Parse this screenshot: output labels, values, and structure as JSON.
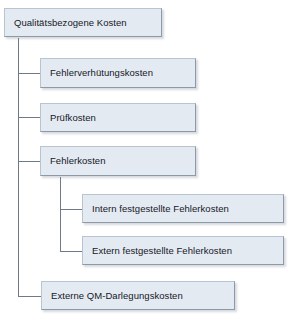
{
  "diagram": {
    "title": "Qualitätsbezogene Kosten",
    "type": "tree-hierarchy",
    "orientation": "vertical-left-trunk",
    "colors": {
      "box_fill": "#e4eaf2",
      "box_border_light": "#b9c4d2",
      "box_border_dark": "#8e99a8",
      "connector_line": "#6f7a88",
      "text": "#14181f",
      "background": "#ffffff"
    },
    "nodes": [
      {
        "id": "root",
        "label": "Qualitätsbezogene Kosten",
        "level": 0,
        "x": 4,
        "y": 8,
        "w": 158,
        "h": 29
      },
      {
        "id": "fehlerverhuetungskosten",
        "label": "Fehlerverhütungskosten",
        "level": 1,
        "x": 40,
        "y": 58,
        "w": 156,
        "h": 30
      },
      {
        "id": "pruefkosten",
        "label": "Prüfkosten",
        "level": 1,
        "x": 40,
        "y": 103,
        "w": 156,
        "h": 29
      },
      {
        "id": "fehlerkosten",
        "label": "Fehlerkosten",
        "level": 1,
        "x": 40,
        "y": 146,
        "w": 156,
        "h": 30
      },
      {
        "id": "intern-festgestellte-fehlerkosten",
        "label": "Intern festgestellte Fehlerkosten",
        "level": 2,
        "x": 82,
        "y": 194,
        "w": 202,
        "h": 29
      },
      {
        "id": "extern-festgestellte-fehlerkosten",
        "label": "Extern festgestellte Fehlerkosten",
        "level": 2,
        "x": 82,
        "y": 236,
        "w": 202,
        "h": 29
      },
      {
        "id": "externe-qm-darlegungskosten",
        "label": "Externe QM-Darlegungskosten",
        "level": 1,
        "x": 41,
        "y": 281,
        "w": 194,
        "h": 29
      }
    ],
    "connectors": [
      {
        "id": "trunk-main",
        "from": "root",
        "x1": 18,
        "y1": 37,
        "x2": 18,
        "y2": 296
      },
      {
        "id": "branch-fehlerverhuetungskosten",
        "to": "fehlerverhuetungskosten",
        "x1": 18,
        "y1": 73,
        "x2": 40,
        "y2": 73
      },
      {
        "id": "branch-pruefkosten",
        "to": "pruefkosten",
        "x1": 18,
        "y1": 117,
        "x2": 40,
        "y2": 117
      },
      {
        "id": "branch-fehlerkosten",
        "to": "fehlerkosten",
        "x1": 18,
        "y1": 161,
        "x2": 40,
        "y2": 161
      },
      {
        "id": "branch-externe-qm",
        "to": "externe-qm-darlegungskosten",
        "x1": 18,
        "y1": 296,
        "x2": 41,
        "y2": 296
      },
      {
        "id": "trunk-sub",
        "from": "fehlerkosten",
        "x1": 60,
        "y1": 176,
        "x2": 60,
        "y2": 251
      },
      {
        "id": "branch-intern",
        "to": "intern-festgestellte-fehlerkosten",
        "x1": 60,
        "y1": 209,
        "x2": 82,
        "y2": 209
      },
      {
        "id": "branch-extern",
        "to": "extern-festgestellte-fehlerkosten",
        "x1": 60,
        "y1": 251,
        "x2": 82,
        "y2": 251
      }
    ]
  }
}
